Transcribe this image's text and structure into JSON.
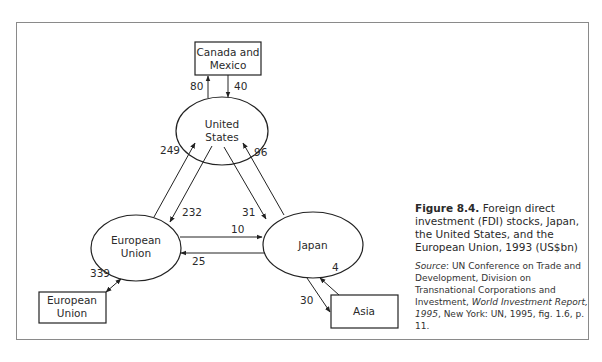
{
  "figure": {
    "number": "Figure 8.4.",
    "title": "Foreign direct investment (FDI) stocks, Japan, the United States, and the European Union, 1993 (US$bn)",
    "source_label": "Source",
    "source_text_1": ": UN Conference on Trade and Development, Division on Transnational Corporations and Investment, ",
    "source_italic": "World Investment Report, 1995",
    "source_text_2": ", New York: UN, 1995, fig. 1.6, p. 11."
  },
  "nodes": {
    "canada_mexico": {
      "line1": "Canada and",
      "line2": "Mexico",
      "shape": "box"
    },
    "united_states": {
      "line1": "United",
      "line2": "States",
      "shape": "ellipse"
    },
    "european_union": {
      "line1": "European",
      "line2": "Union",
      "shape": "ellipse"
    },
    "japan": {
      "line1": "Japan",
      "shape": "ellipse"
    },
    "european_union_box": {
      "line1": "European",
      "line2": "Union",
      "shape": "box"
    },
    "asia": {
      "line1": "Asia",
      "shape": "box"
    }
  },
  "edges": [
    {
      "from": "United States",
      "to": "Canada and Mexico",
      "value": "80"
    },
    {
      "from": "Canada and Mexico",
      "to": "United States",
      "value": "40"
    },
    {
      "from": "European Union",
      "to": "United States",
      "value": "249"
    },
    {
      "from": "United States",
      "to": "European Union",
      "value": "232"
    },
    {
      "from": "United States",
      "to": "Japan",
      "value": "31"
    },
    {
      "from": "Japan",
      "to": "United States",
      "value": "96"
    },
    {
      "from": "European Union",
      "to": "Japan",
      "value": "10"
    },
    {
      "from": "Japan",
      "to": "European Union",
      "value": "25"
    },
    {
      "from": "European Union",
      "to": "European Union (box)",
      "value": "339",
      "bidirectional": true
    },
    {
      "from": "Asia",
      "to": "Japan",
      "value": "4"
    },
    {
      "from": "Japan",
      "to": "Asia",
      "value": "30"
    }
  ]
}
